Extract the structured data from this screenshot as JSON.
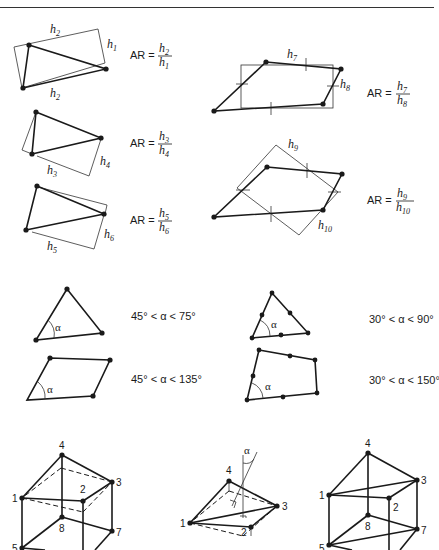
{
  "header": {
    "text": "Element distortion"
  },
  "aspect_ratio": {
    "triangles": [
      {
        "id": "tri-1",
        "top_label": "h2",
        "side_label": "h1",
        "bottom_label": "h2",
        "formula": {
          "lhs": "AR =",
          "num": "h2",
          "den": "h1"
        }
      },
      {
        "id": "tri-2",
        "bottom_label": "h3",
        "side_label": "h4",
        "formula": {
          "lhs": "AR =",
          "num": "h3",
          "den": "h4"
        }
      },
      {
        "id": "tri-3",
        "bottom_label": "h5",
        "side_label": "h6",
        "formula": {
          "lhs": "AR =",
          "num": "h5",
          "den": "h6"
        }
      }
    ],
    "quads": [
      {
        "id": "quad-1",
        "top_label": "h7",
        "side_label": "h8",
        "formula": {
          "lhs": "AR =",
          "num": "h7",
          "den": "h8"
        }
      },
      {
        "id": "quad-2",
        "top_label": "h9",
        "side_label": "h10",
        "formula": {
          "lhs": "AR =",
          "num": "h9",
          "den": "h10"
        }
      }
    ]
  },
  "angle_limits": {
    "linear_triangle": {
      "angle": "α",
      "range": "45° < α < 75°"
    },
    "linear_quad": {
      "angle": "α",
      "range": "45° < α < 135°"
    },
    "quadratic_triangle": {
      "angle": "α",
      "range": "30° < α < 90°"
    },
    "quadratic_quad": {
      "angle": "α",
      "range": "30° < α < 150°"
    }
  },
  "solids": [
    {
      "id": "hexahedron",
      "nodes": [
        "1",
        "2",
        "3",
        "4",
        "5",
        "7",
        "8"
      ]
    },
    {
      "id": "warped-face",
      "nodes": [
        "1",
        "2",
        "3",
        "4"
      ],
      "angle": "α"
    },
    {
      "id": "wedge-split",
      "nodes": [
        "1",
        "2",
        "3",
        "4",
        "5",
        "7",
        "8"
      ]
    }
  ]
}
